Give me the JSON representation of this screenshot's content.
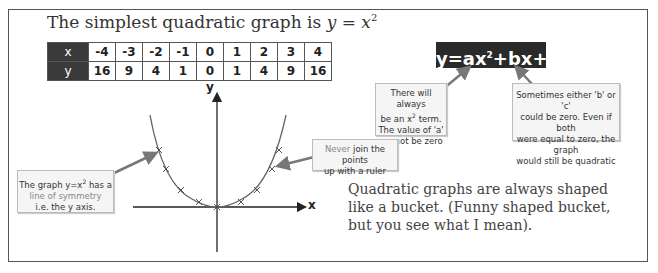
{
  "title": {
    "prefix": "The simplest quadratic graph is ",
    "equation_y": "y",
    "equals": " = ",
    "equation_x": "x",
    "exponent": "2"
  },
  "table": {
    "rows": [
      {
        "label": "x",
        "values": [
          "-4",
          "-3",
          "-2",
          "-1",
          "0",
          "1",
          "2",
          "3",
          "4"
        ]
      },
      {
        "label": "y",
        "values": [
          "16",
          "9",
          "4",
          "1",
          "0",
          "1",
          "4",
          "9",
          "16"
        ]
      }
    ]
  },
  "general_equation": {
    "before": "y=ax",
    "exponent": "2",
    "after": "+bx+c"
  },
  "notes": {
    "a_term": {
      "line1": "There will always",
      "line2_pre": "be an x",
      "line2_sup": "2",
      "line2_post": " term.",
      "line3": "The value of 'a'",
      "line4": "cannot be zero"
    },
    "b_c_zero": {
      "line1": "Sometimes either 'b' or 'c'",
      "line2": "could be zero. Even if both",
      "line3": "were equal to zero, the graph",
      "line4": "would still be quadratic"
    },
    "ruler": {
      "highlight": "Never",
      "line1_rest": " join the points",
      "line2": "up with a ruler"
    },
    "symmetry": {
      "line1_pre": "The graph y=x",
      "line1_sup": "2",
      "line1_post": " has a",
      "line2": "line of symmetry",
      "line3": "i.e. the y axis."
    }
  },
  "graph": {
    "x_axis_label": "x",
    "y_axis_label": "y",
    "curve": "y = x^2",
    "points_x": [
      -4,
      -3,
      -2,
      -1,
      0,
      1,
      2,
      3,
      4
    ]
  },
  "bucket_text": {
    "line1": "Quadratic graphs are always shaped",
    "line2": "like a bucket. (Funny shaped bucket,",
    "line3": "but you see what I mean)."
  },
  "colors": {
    "dark": "#2a2a2a",
    "arrow": "#777777",
    "note_bg": "#f5f5f5",
    "curve": "#666666"
  }
}
